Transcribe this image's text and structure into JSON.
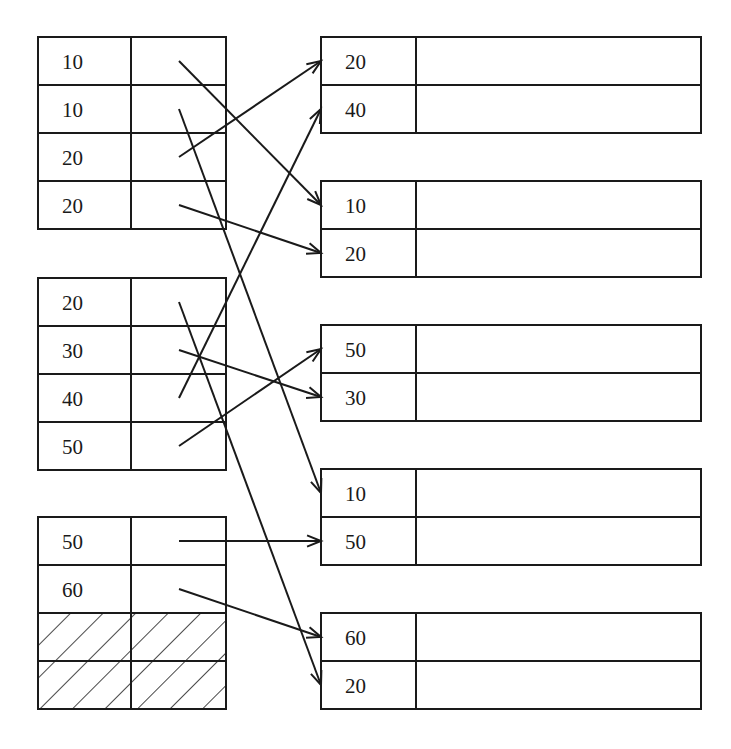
{
  "diagram": {
    "type": "pointer-mapping",
    "stroke_color": "#1a1a1a",
    "background": "#ffffff",
    "left_blocks": [
      {
        "rows": [
          {
            "key": "10"
          },
          {
            "key": "10"
          },
          {
            "key": "20"
          },
          {
            "key": "20"
          }
        ]
      },
      {
        "rows": [
          {
            "key": "20"
          },
          {
            "key": "30"
          },
          {
            "key": "40"
          },
          {
            "key": "50"
          }
        ]
      },
      {
        "rows": [
          {
            "key": "50"
          },
          {
            "key": "60"
          },
          {
            "key": "",
            "hatched": true
          },
          {
            "key": "",
            "hatched": true
          }
        ]
      }
    ],
    "right_blocks": [
      {
        "rows": [
          {
            "key": "20"
          },
          {
            "key": "40"
          }
        ]
      },
      {
        "rows": [
          {
            "key": "10"
          },
          {
            "key": "20"
          }
        ]
      },
      {
        "rows": [
          {
            "key": "50"
          },
          {
            "key": "30"
          }
        ]
      },
      {
        "rows": [
          {
            "key": "10"
          },
          {
            "key": "50"
          }
        ]
      },
      {
        "rows": [
          {
            "key": "60"
          },
          {
            "key": "20"
          }
        ]
      }
    ],
    "arrows": [
      {
        "from": [
          0,
          0
        ],
        "to": [
          1,
          0
        ]
      },
      {
        "from": [
          0,
          1
        ],
        "to": [
          3,
          0
        ]
      },
      {
        "from": [
          0,
          2
        ],
        "to": [
          0,
          0
        ]
      },
      {
        "from": [
          0,
          3
        ],
        "to": [
          1,
          1
        ]
      },
      {
        "from": [
          1,
          0
        ],
        "to": [
          4,
          1
        ]
      },
      {
        "from": [
          1,
          1
        ],
        "to": [
          2,
          1
        ]
      },
      {
        "from": [
          1,
          2
        ],
        "to": [
          0,
          1
        ]
      },
      {
        "from": [
          1,
          3
        ],
        "to": [
          2,
          0
        ]
      },
      {
        "from": [
          2,
          0
        ],
        "to": [
          3,
          1
        ]
      },
      {
        "from": [
          2,
          1
        ],
        "to": [
          4,
          0
        ]
      }
    ]
  }
}
